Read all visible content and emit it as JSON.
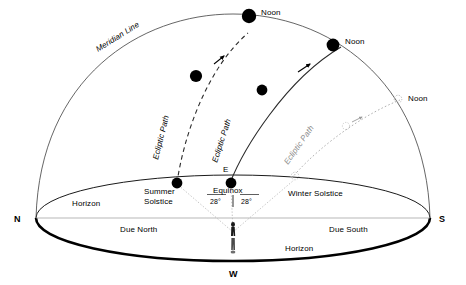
{
  "diagram": {
    "cardinals": {
      "north": "N",
      "south": "S",
      "west": "W",
      "east": "E"
    },
    "ground_labels": {
      "horizon_left": "Horizon",
      "horizon_bottom": "Horizon",
      "due_north": "Due North",
      "due_south": "Due South"
    },
    "sun_positions": [
      {
        "id": "noon-summer",
        "label": "Noon"
      },
      {
        "id": "noon-equinox",
        "label": "Noon"
      },
      {
        "id": "noon-winter",
        "label": "Noon"
      }
    ],
    "paths": [
      {
        "id": "summer-solstice-path",
        "label": "Ecliptic Path",
        "style": "dashed",
        "rise_label_line1": "Summer",
        "rise_label_line2": "Solstice"
      },
      {
        "id": "equinox-path",
        "label": "Ecliptic Path",
        "style": "solid",
        "rise_label_line1": "Equinox",
        "rise_label_line2": ""
      },
      {
        "id": "winter-solstice-path",
        "label": "Ecliptic Path",
        "style": "faint-dashed",
        "rise_label_line1": "Winter Solstice",
        "rise_label_line2": ""
      }
    ],
    "meridian": {
      "label": "Meridian Line"
    },
    "angles": {
      "left": "28°",
      "right": "28°"
    },
    "observer": {
      "label": "observer-figure"
    },
    "colors": {
      "ink": "#000000",
      "faint": "#8a8a8a",
      "ground_line": "#8a8a8a",
      "background": "#ffffff"
    }
  }
}
